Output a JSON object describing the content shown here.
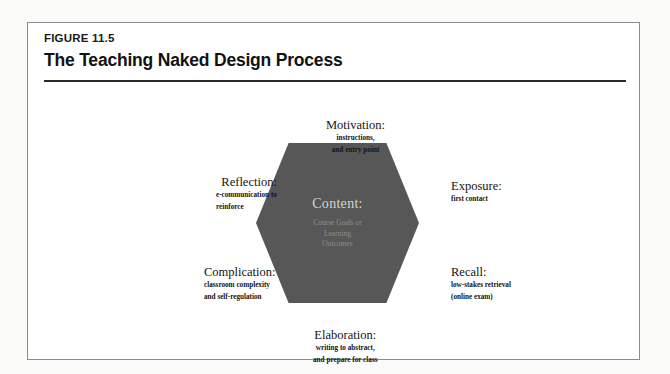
{
  "figure": {
    "label": "FIGURE 11.5",
    "title": "The Teaching Naked Design Process"
  },
  "bleed_through": {
    "title_ghost": "The Teaching Naked Process"
  },
  "diagram": {
    "type": "hexagon-cycle",
    "center": {
      "title": "Content:",
      "subtitle_lines": [
        "Course Goals or",
        "Learning",
        "Outcomes"
      ],
      "fill_color": "#575757",
      "title_color": "#d3d3d3",
      "subtitle_color": "#8e8e8e"
    },
    "nodes": [
      {
        "id": "motivation",
        "title": "Motivation:",
        "sub_lines": [
          "instructions,",
          "and entry point"
        ],
        "position": "top"
      },
      {
        "id": "exposure",
        "title": "Exposure:",
        "sub_lines": [
          "first contact"
        ],
        "position": "right-upper"
      },
      {
        "id": "recall",
        "title": "Recall:",
        "sub_lines": [
          "low-stakes retrieval",
          "(online exam)"
        ],
        "position": "right-lower"
      },
      {
        "id": "elaboration",
        "title": "Elaboration:",
        "sub_lines": [
          "writing to abstract,",
          "and prepare for class"
        ],
        "position": "bottom"
      },
      {
        "id": "complication",
        "title": "Complication:",
        "sub_lines": [
          "classroom complexity",
          "and self-regulation"
        ],
        "position": "left-lower"
      },
      {
        "id": "reflection",
        "title": "Reflection:",
        "sub_lines": [
          "e-communication to",
          "reinforce"
        ],
        "position": "left-upper"
      }
    ]
  }
}
